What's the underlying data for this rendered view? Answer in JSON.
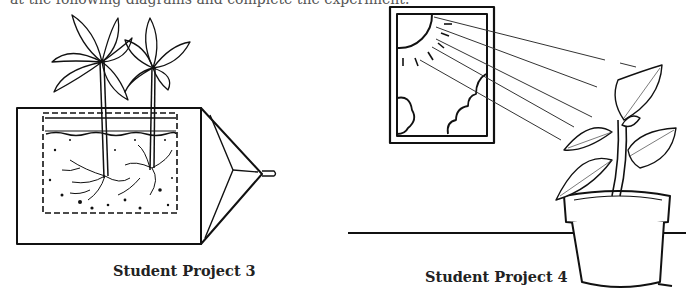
{
  "page": {
    "top_text_fragment": "at the following diagrams and complete the experiment."
  },
  "figures": [
    {
      "id": "project-3",
      "caption": "Student Project 3",
      "description": "Two bean seedlings growing in a soil-filled box with a clear side showing roots, attached to a funnel-like cone"
    },
    {
      "id": "project-4",
      "caption": "Student Project 4",
      "description": "Potted plant on a shelf leaning toward light rays coming from the sun through a window"
    }
  ],
  "colors": {
    "ink": "#111111",
    "background": "#ffffff"
  }
}
